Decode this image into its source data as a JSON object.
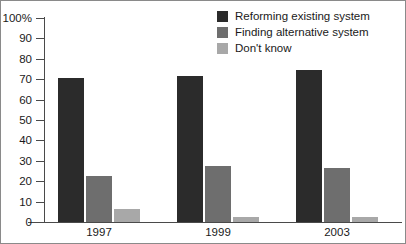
{
  "chart_data": {
    "type": "bar",
    "title": "",
    "subtitle": "",
    "xlabel": "",
    "ylabel": "",
    "categories": [
      "1997",
      "1999",
      "2003"
    ],
    "series": [
      {
        "name": "Reforming existing system",
        "color": "#2b2b2b",
        "values": [
          71,
          72,
          75
        ]
      },
      {
        "name": "Finding alternative system",
        "color": "#6e6e6e",
        "values": [
          23,
          28,
          27
        ]
      },
      {
        "name": "Don't know",
        "color": "#a8a8a8",
        "values": [
          7,
          3,
          3
        ]
      }
    ],
    "ylim": [
      0,
      100
    ],
    "y_ticks": [
      {
        "value": 100,
        "label": "100%"
      },
      {
        "value": 90,
        "label": "90"
      },
      {
        "value": 80,
        "label": "80"
      },
      {
        "value": 70,
        "label": "70"
      },
      {
        "value": 60,
        "label": "60"
      },
      {
        "value": 50,
        "label": "50"
      },
      {
        "value": 40,
        "label": "40"
      },
      {
        "value": 30,
        "label": "30"
      },
      {
        "value": 20,
        "label": "20"
      },
      {
        "value": 10,
        "label": "10"
      },
      {
        "value": 0,
        "label": "0"
      }
    ],
    "grid": false,
    "legend_position": "top-right"
  }
}
